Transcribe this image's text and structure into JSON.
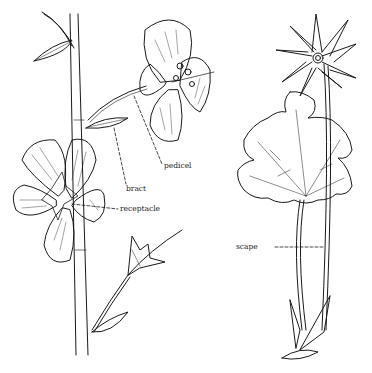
{
  "figure": {
    "labels": {
      "pedicel": "pedicel",
      "bract": "bract",
      "receptacle": "receptacle",
      "scape": "scape"
    },
    "colors": {
      "ink": "#1a1a1a",
      "background": "#ffffff"
    }
  }
}
